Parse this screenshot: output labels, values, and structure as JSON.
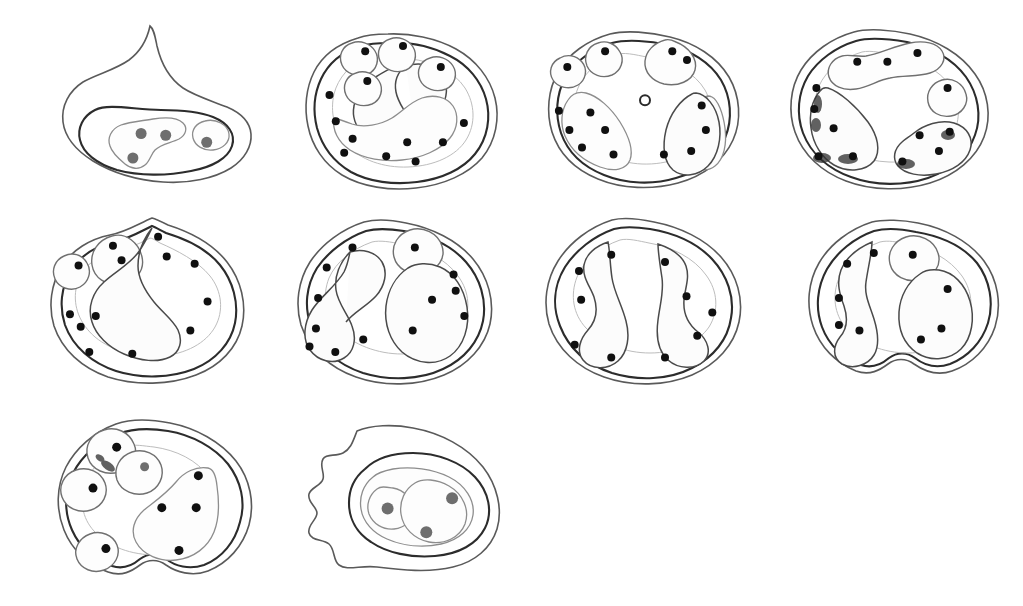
{
  "figure": {
    "background_color": "#ffffff",
    "ink_color": "#2c2c2c",
    "dot_black": "#101010",
    "dot_gray": "#6e6e6e",
    "panel_count": 10,
    "rows": [
      4,
      4,
      2
    ],
    "caption": ""
  },
  "panels": [
    {
      "id": "panel-1",
      "index": 1,
      "label": "",
      "position": {
        "x": 55,
        "y": 18,
        "width": 205,
        "height": 175
      },
      "shape": "hooked-crest outline with elongate lower core",
      "contour_count": 2,
      "dot_total": 4,
      "dot_black_count": 0,
      "dot_gray_count": 4,
      "has_open_ring": false,
      "has_smudge": false,
      "dots": [
        {
          "x": 0.42,
          "y": 0.66,
          "color": "gray",
          "r": 5.5
        },
        {
          "x": 0.54,
          "y": 0.67,
          "color": "gray",
          "r": 5.5
        },
        {
          "x": 0.38,
          "y": 0.8,
          "color": "gray",
          "r": 5.5
        },
        {
          "x": 0.74,
          "y": 0.71,
          "color": "gray",
          "r": 5.5
        }
      ]
    },
    {
      "id": "panel-2",
      "index": 2,
      "label": "",
      "position": {
        "x": 298,
        "y": 18,
        "width": 210,
        "height": 175
      },
      "shape": "rounded lobed outline, four satellite pods on upper margin",
      "contour_count": 3,
      "dot_total": 13,
      "dot_black_count": 13,
      "dot_gray_count": 0,
      "has_open_ring": false,
      "has_smudge": false,
      "dots": [
        {
          "x": 0.32,
          "y": 0.19,
          "color": "black",
          "r": 4
        },
        {
          "x": 0.5,
          "y": 0.16,
          "color": "black",
          "r": 4
        },
        {
          "x": 0.68,
          "y": 0.28,
          "color": "black",
          "r": 4
        },
        {
          "x": 0.33,
          "y": 0.36,
          "color": "black",
          "r": 4
        },
        {
          "x": 0.15,
          "y": 0.44,
          "color": "black",
          "r": 4
        },
        {
          "x": 0.18,
          "y": 0.59,
          "color": "black",
          "r": 4
        },
        {
          "x": 0.26,
          "y": 0.69,
          "color": "black",
          "r": 4
        },
        {
          "x": 0.22,
          "y": 0.77,
          "color": "black",
          "r": 4
        },
        {
          "x": 0.52,
          "y": 0.71,
          "color": "black",
          "r": 4
        },
        {
          "x": 0.56,
          "y": 0.82,
          "color": "black",
          "r": 4
        },
        {
          "x": 0.69,
          "y": 0.71,
          "color": "black",
          "r": 4
        },
        {
          "x": 0.79,
          "y": 0.6,
          "color": "black",
          "r": 4
        },
        {
          "x": 0.42,
          "y": 0.79,
          "color": "black",
          "r": 4
        }
      ]
    },
    {
      "id": "panel-3",
      "index": 3,
      "label": "",
      "position": {
        "x": 540,
        "y": 18,
        "width": 210,
        "height": 175
      },
      "shape": "broad oval, three upper pods, two large basal lobes, central open ring",
      "contour_count": 3,
      "dot_total": 14,
      "dot_black_count": 14,
      "dot_gray_count": 0,
      "has_open_ring": true,
      "has_smudge": false,
      "dots": [
        {
          "x": 0.31,
          "y": 0.19,
          "color": "black",
          "r": 4
        },
        {
          "x": 0.13,
          "y": 0.28,
          "color": "black",
          "r": 4
        },
        {
          "x": 0.63,
          "y": 0.19,
          "color": "black",
          "r": 4
        },
        {
          "x": 0.7,
          "y": 0.24,
          "color": "black",
          "r": 4
        },
        {
          "x": 0.09,
          "y": 0.53,
          "color": "black",
          "r": 4
        },
        {
          "x": 0.24,
          "y": 0.54,
          "color": "black",
          "r": 4
        },
        {
          "x": 0.14,
          "y": 0.64,
          "color": "black",
          "r": 4
        },
        {
          "x": 0.31,
          "y": 0.64,
          "color": "black",
          "r": 4
        },
        {
          "x": 0.2,
          "y": 0.74,
          "color": "black",
          "r": 4
        },
        {
          "x": 0.35,
          "y": 0.78,
          "color": "black",
          "r": 4
        },
        {
          "x": 0.77,
          "y": 0.5,
          "color": "black",
          "r": 4
        },
        {
          "x": 0.79,
          "y": 0.64,
          "color": "black",
          "r": 4
        },
        {
          "x": 0.72,
          "y": 0.76,
          "color": "black",
          "r": 4
        },
        {
          "x": 0.59,
          "y": 0.78,
          "color": "black",
          "r": 4
        }
      ],
      "open_ring": {
        "x": 0.5,
        "y": 0.47,
        "r": 5
      }
    },
    {
      "id": "panel-4",
      "index": 4,
      "label": "",
      "position": {
        "x": 782,
        "y": 18,
        "width": 215,
        "height": 175
      },
      "shape": "oval with chained upper pod, wedge lobes, ink smudges at base",
      "contour_count": 3,
      "dot_total": 13,
      "dot_black_count": 13,
      "dot_gray_count": 0,
      "has_open_ring": false,
      "has_smudge": true,
      "dots": [
        {
          "x": 0.35,
          "y": 0.25,
          "color": "black",
          "r": 4
        },
        {
          "x": 0.49,
          "y": 0.25,
          "color": "black",
          "r": 4
        },
        {
          "x": 0.63,
          "y": 0.2,
          "color": "black",
          "r": 4
        },
        {
          "x": 0.77,
          "y": 0.4,
          "color": "black",
          "r": 4
        },
        {
          "x": 0.16,
          "y": 0.4,
          "color": "black",
          "r": 4
        },
        {
          "x": 0.15,
          "y": 0.52,
          "color": "black",
          "r": 4
        },
        {
          "x": 0.24,
          "y": 0.63,
          "color": "black",
          "r": 4
        },
        {
          "x": 0.17,
          "y": 0.79,
          "color": "black",
          "r": 4
        },
        {
          "x": 0.33,
          "y": 0.79,
          "color": "black",
          "r": 4
        },
        {
          "x": 0.64,
          "y": 0.67,
          "color": "black",
          "r": 4
        },
        {
          "x": 0.78,
          "y": 0.65,
          "color": "black",
          "r": 4
        },
        {
          "x": 0.73,
          "y": 0.76,
          "color": "black",
          "r": 4
        },
        {
          "x": 0.56,
          "y": 0.82,
          "color": "black",
          "r": 4
        }
      ]
    },
    {
      "id": "panel-5",
      "index": 5,
      "label": "",
      "position": {
        "x": 42,
        "y": 208,
        "width": 215,
        "height": 180
      },
      "shape": "oval with apical peak, two upper pods, sinuous median lobe",
      "contour_count": 3,
      "dot_total": 13,
      "dot_black_count": 13,
      "dot_gray_count": 0,
      "has_open_ring": false,
      "has_smudge": false,
      "dots": [
        {
          "x": 0.33,
          "y": 0.21,
          "color": "black",
          "r": 4
        },
        {
          "x": 0.37,
          "y": 0.29,
          "color": "black",
          "r": 4
        },
        {
          "x": 0.17,
          "y": 0.32,
          "color": "black",
          "r": 4
        },
        {
          "x": 0.54,
          "y": 0.16,
          "color": "black",
          "r": 4
        },
        {
          "x": 0.58,
          "y": 0.27,
          "color": "black",
          "r": 4
        },
        {
          "x": 0.71,
          "y": 0.31,
          "color": "black",
          "r": 4
        },
        {
          "x": 0.77,
          "y": 0.52,
          "color": "black",
          "r": 4
        },
        {
          "x": 0.69,
          "y": 0.68,
          "color": "black",
          "r": 4
        },
        {
          "x": 0.13,
          "y": 0.59,
          "color": "black",
          "r": 4
        },
        {
          "x": 0.18,
          "y": 0.66,
          "color": "black",
          "r": 4
        },
        {
          "x": 0.25,
          "y": 0.6,
          "color": "black",
          "r": 4
        },
        {
          "x": 0.22,
          "y": 0.8,
          "color": "black",
          "r": 4
        },
        {
          "x": 0.42,
          "y": 0.81,
          "color": "black",
          "r": 4
        }
      ]
    },
    {
      "id": "panel-6",
      "index": 6,
      "label": "",
      "position": {
        "x": 288,
        "y": 208,
        "width": 215,
        "height": 180
      },
      "shape": "broad oval, single upper pod, hooked median lobe, right basal lobe",
      "contour_count": 3,
      "dot_total": 13,
      "dot_black_count": 13,
      "dot_gray_count": 0,
      "has_open_ring": false,
      "has_smudge": false,
      "dots": [
        {
          "x": 0.3,
          "y": 0.22,
          "color": "black",
          "r": 4
        },
        {
          "x": 0.18,
          "y": 0.33,
          "color": "black",
          "r": 4
        },
        {
          "x": 0.14,
          "y": 0.5,
          "color": "black",
          "r": 4
        },
        {
          "x": 0.13,
          "y": 0.67,
          "color": "black",
          "r": 4
        },
        {
          "x": 0.1,
          "y": 0.77,
          "color": "black",
          "r": 4
        },
        {
          "x": 0.22,
          "y": 0.8,
          "color": "black",
          "r": 4
        },
        {
          "x": 0.35,
          "y": 0.73,
          "color": "black",
          "r": 4
        },
        {
          "x": 0.59,
          "y": 0.22,
          "color": "black",
          "r": 4
        },
        {
          "x": 0.77,
          "y": 0.37,
          "color": "black",
          "r": 4
        },
        {
          "x": 0.78,
          "y": 0.46,
          "color": "black",
          "r": 4
        },
        {
          "x": 0.67,
          "y": 0.51,
          "color": "black",
          "r": 4
        },
        {
          "x": 0.82,
          "y": 0.6,
          "color": "black",
          "r": 4
        },
        {
          "x": 0.58,
          "y": 0.68,
          "color": "black",
          "r": 4
        }
      ]
    },
    {
      "id": "panel-7",
      "index": 7,
      "label": "",
      "position": {
        "x": 536,
        "y": 208,
        "width": 215,
        "height": 180
      },
      "shape": "bilateral oval, two mirrored vertical lobes, no pods",
      "contour_count": 3,
      "dot_total": 10,
      "dot_black_count": 10,
      "dot_gray_count": 0,
      "has_open_ring": false,
      "has_smudge": false,
      "dots": [
        {
          "x": 0.35,
          "y": 0.26,
          "color": "black",
          "r": 4
        },
        {
          "x": 0.2,
          "y": 0.35,
          "color": "black",
          "r": 4
        },
        {
          "x": 0.21,
          "y": 0.51,
          "color": "black",
          "r": 4
        },
        {
          "x": 0.18,
          "y": 0.76,
          "color": "black",
          "r": 4
        },
        {
          "x": 0.35,
          "y": 0.83,
          "color": "black",
          "r": 4
        },
        {
          "x": 0.6,
          "y": 0.3,
          "color": "black",
          "r": 4
        },
        {
          "x": 0.7,
          "y": 0.49,
          "color": "black",
          "r": 4
        },
        {
          "x": 0.82,
          "y": 0.58,
          "color": "black",
          "r": 4
        },
        {
          "x": 0.75,
          "y": 0.71,
          "color": "black",
          "r": 4
        },
        {
          "x": 0.6,
          "y": 0.83,
          "color": "black",
          "r": 4
        }
      ]
    },
    {
      "id": "panel-8",
      "index": 8,
      "label": "",
      "position": {
        "x": 800,
        "y": 208,
        "width": 205,
        "height": 180
      },
      "shape": "oval with notched base, one upper pod, C-shaped left lobe, right lobe",
      "contour_count": 3,
      "dot_total": 9,
      "dot_black_count": 9,
      "dot_gray_count": 0,
      "has_open_ring": false,
      "has_smudge": false,
      "dots": [
        {
          "x": 0.36,
          "y": 0.25,
          "color": "black",
          "r": 4
        },
        {
          "x": 0.23,
          "y": 0.31,
          "color": "black",
          "r": 4
        },
        {
          "x": 0.19,
          "y": 0.5,
          "color": "black",
          "r": 4
        },
        {
          "x": 0.19,
          "y": 0.65,
          "color": "black",
          "r": 4
        },
        {
          "x": 0.29,
          "y": 0.68,
          "color": "black",
          "r": 4
        },
        {
          "x": 0.55,
          "y": 0.26,
          "color": "black",
          "r": 4
        },
        {
          "x": 0.72,
          "y": 0.45,
          "color": "black",
          "r": 4
        },
        {
          "x": 0.69,
          "y": 0.67,
          "color": "black",
          "r": 4
        },
        {
          "x": 0.59,
          "y": 0.73,
          "color": "black",
          "r": 4
        }
      ]
    },
    {
      "id": "panel-9",
      "index": 9,
      "label": "",
      "position": {
        "x": 50,
        "y": 408,
        "width": 215,
        "height": 178
      },
      "shape": "rounded outline, four small pods plus large right cluster lobe",
      "contour_count": 2,
      "dot_total": 8,
      "dot_black_count": 7,
      "dot_gray_count": 1,
      "has_open_ring": false,
      "has_smudge": true,
      "dots": [
        {
          "x": 0.31,
          "y": 0.22,
          "color": "black",
          "r": 4.5
        },
        {
          "x": 0.2,
          "y": 0.45,
          "color": "black",
          "r": 4.5
        },
        {
          "x": 0.44,
          "y": 0.33,
          "color": "gray",
          "r": 4.5
        },
        {
          "x": 0.69,
          "y": 0.38,
          "color": "black",
          "r": 4.5
        },
        {
          "x": 0.52,
          "y": 0.56,
          "color": "black",
          "r": 4.5
        },
        {
          "x": 0.68,
          "y": 0.56,
          "color": "black",
          "r": 4.5
        },
        {
          "x": 0.26,
          "y": 0.79,
          "color": "black",
          "r": 4.5
        },
        {
          "x": 0.6,
          "y": 0.8,
          "color": "black",
          "r": 4.5
        }
      ]
    },
    {
      "id": "panel-10",
      "index": 10,
      "label": "",
      "position": {
        "x": 293,
        "y": 415,
        "width": 215,
        "height": 170
      },
      "shape": "angular outline with pointed left margin, twin-lobed right core",
      "contour_count": 3,
      "dot_total": 3,
      "dot_black_count": 0,
      "dot_gray_count": 3,
      "has_open_ring": false,
      "has_smudge": false,
      "dots": [
        {
          "x": 0.44,
          "y": 0.55,
          "color": "gray",
          "r": 6
        },
        {
          "x": 0.74,
          "y": 0.49,
          "color": "gray",
          "r": 6
        },
        {
          "x": 0.62,
          "y": 0.69,
          "color": "gray",
          "r": 6
        }
      ]
    }
  ]
}
